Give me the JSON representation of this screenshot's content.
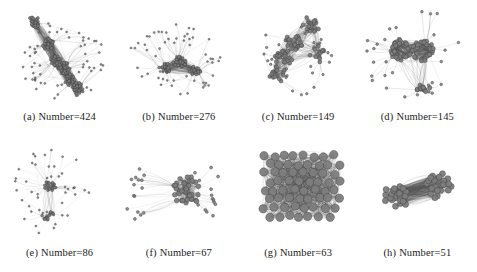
{
  "figure": {
    "kind": "network-graph-grid",
    "background_color": "#ffffff",
    "node_color": "#7d7d7d",
    "node_stroke_color": "#3a3a3a",
    "edge_color": "#555555",
    "caption_color": "#1c1c1c",
    "columns": 4,
    "rows": 2
  },
  "panels": [
    {
      "tag": "(a)",
      "caption": "(a) Number=424",
      "label": "Number=424",
      "count": 424,
      "layout": "elongated-diagonal-chains",
      "seed": 101,
      "core_count": 5,
      "hub_nodes": 150,
      "satellite_nodes": 60,
      "edge_density": 0.9,
      "node_radius": 1.5,
      "ink": 0.95
    },
    {
      "tag": "(b)",
      "caption": "(b) Number=276",
      "label": "Number=276",
      "count": 276,
      "layout": "compact-core-with-filaments",
      "seed": 202,
      "core_count": 3,
      "hub_nodes": 95,
      "satellite_nodes": 55,
      "edge_density": 0.8,
      "node_radius": 1.5,
      "ink": 0.8
    },
    {
      "tag": "(c)",
      "caption": "(c) Number=149",
      "label": "Number=149",
      "count": 149,
      "layout": "stacked-clusters-diagonal",
      "seed": 303,
      "core_count": 4,
      "hub_nodes": 80,
      "satellite_nodes": 30,
      "edge_density": 0.95,
      "node_radius": 2.0,
      "ink": 1.0
    },
    {
      "tag": "(d)",
      "caption": "(d) Number=145",
      "label": "Number=145",
      "count": 145,
      "layout": "twin-rings-with-long-spokes",
      "seed": 404,
      "core_count": 2,
      "hub_nodes": 70,
      "satellite_nodes": 28,
      "edge_density": 0.9,
      "node_radius": 2.2,
      "ink": 1.0
    },
    {
      "tag": "(e)",
      "caption": "(e) Number=86",
      "label": "Number=86",
      "count": 86,
      "layout": "sparse-single-core-branches",
      "seed": 505,
      "core_count": 2,
      "hub_nodes": 40,
      "satellite_nodes": 46,
      "edge_density": 0.55,
      "node_radius": 1.4,
      "ink": 0.6
    },
    {
      "tag": "(f)",
      "caption": "(f) Number=67",
      "label": "Number=67",
      "count": 67,
      "layout": "hub-and-spoke",
      "seed": 606,
      "core_count": 1,
      "hub_nodes": 38,
      "satellite_nodes": 29,
      "edge_density": 0.7,
      "node_radius": 2.4,
      "ink": 0.75
    },
    {
      "tag": "(g)",
      "caption": "(g) Number=63",
      "label": "Number=63",
      "count": 63,
      "layout": "dense-near-complete-blob",
      "seed": 707,
      "core_count": 1,
      "hub_nodes": 63,
      "satellite_nodes": 0,
      "edge_density": 1.0,
      "node_radius": 4.2,
      "ink": 1.0
    },
    {
      "tag": "(h)",
      "caption": "(h) Number=51",
      "label": "Number=51",
      "count": 51,
      "layout": "bipartite-dumbbell",
      "seed": 808,
      "core_count": 2,
      "hub_nodes": 51,
      "satellite_nodes": 0,
      "edge_density": 0.95,
      "node_radius": 3.0,
      "ink": 1.0
    }
  ]
}
